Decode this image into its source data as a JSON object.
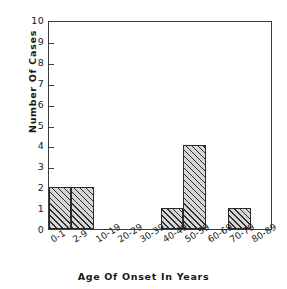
{
  "chart_data": {
    "type": "bar",
    "title": "",
    "xlabel": "Age Of Onset In Years",
    "ylabel": "Number Of Cases",
    "categories": [
      "0-1",
      "2-9",
      "10-19",
      "20-29",
      "30-39",
      "40-49",
      "50-59",
      "60-69",
      "70-79",
      "80-89"
    ],
    "values": [
      2,
      2,
      0,
      0,
      0,
      1,
      4,
      0,
      1,
      0
    ],
    "ylim": [
      0,
      10
    ],
    "yticks": [
      0,
      1,
      2,
      3,
      4,
      5,
      6,
      7,
      8,
      9,
      10
    ],
    "ytick_labels": [
      "0",
      "1",
      "2",
      "3",
      "4",
      "5",
      "6",
      "7",
      "8",
      "9",
      "10"
    ],
    "grid": false,
    "legend": null,
    "bar_fill": "diagonal-hatch",
    "bar_edge_color": "#2a2a2a",
    "frame_color": "#3a3a3a",
    "background": "#ffffff"
  }
}
